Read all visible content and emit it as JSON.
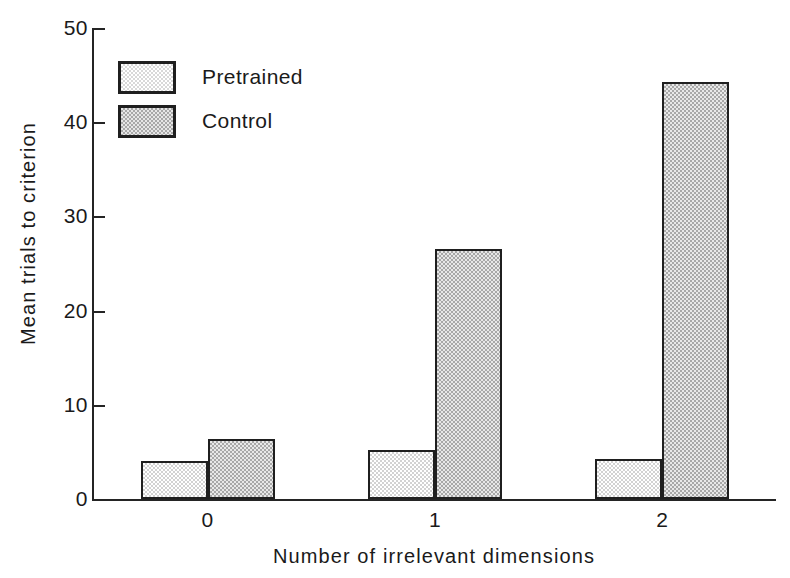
{
  "chart_data": {
    "type": "bar",
    "title": "",
    "subtitle": "",
    "xlabel": "Number of irrelevant dimensions",
    "ylabel": "Mean trials to criterion",
    "categories": [
      "0",
      "1",
      "2"
    ],
    "series": [
      {
        "name": "Pretrained",
        "values": [
          4.0,
          5.2,
          4.2
        ],
        "color": "#e9e9e9"
      },
      {
        "name": "Control",
        "values": [
          6.4,
          26.5,
          44.3
        ],
        "color": "#cfcfcf"
      }
    ],
    "ylim": [
      0,
      50
    ],
    "yticks": [
      0,
      10,
      20,
      30,
      40,
      50
    ],
    "ytick_labels": [
      "0",
      "10",
      "20",
      "30",
      "40",
      "50"
    ],
    "xlim_categories": 3,
    "grid": false,
    "legend_position": "upper-left-inside",
    "annotations": []
  },
  "legend": {
    "entries": [
      {
        "label": "Pretrained",
        "swatch": "light-gray-stipple-swatch"
      },
      {
        "label": "Control",
        "swatch": "medium-gray-stipple-swatch"
      }
    ]
  },
  "axes": {
    "y_title": "Mean trials to criterion",
    "x_title": "Number of irrelevant dimensions"
  }
}
